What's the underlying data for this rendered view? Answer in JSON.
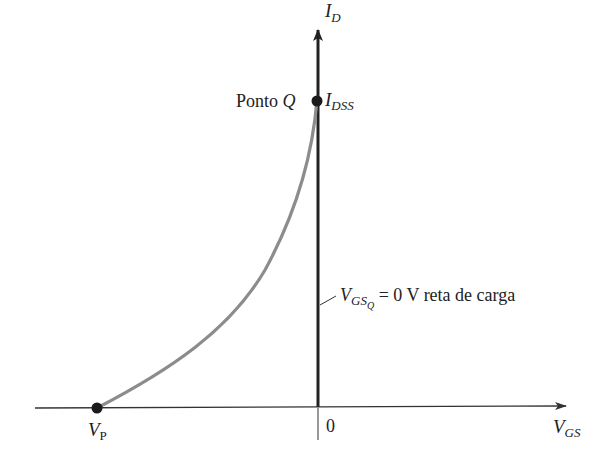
{
  "diagram": {
    "type": "jfet-transfer-characteristic",
    "axes": {
      "x_label_main": "V",
      "x_label_sub": "GS",
      "y_label_main": "I",
      "y_label_sub": "D",
      "origin_label": "0"
    },
    "points": {
      "q_point": {
        "label_text": "Ponto ",
        "label_symbol": "Q",
        "value_main": "I",
        "value_sub": "DSS"
      },
      "pinch_off": {
        "label_main": "V",
        "label_sub": "P"
      }
    },
    "load_line": {
      "label_main": "V",
      "label_sub": "GS",
      "label_subsub": "Q",
      "label_rest": " = 0 V reta de carga"
    },
    "colors": {
      "axis": "#333333",
      "load_line": "#222222",
      "curve": "#8c8c8c",
      "dot": "#1a1a1a"
    }
  }
}
